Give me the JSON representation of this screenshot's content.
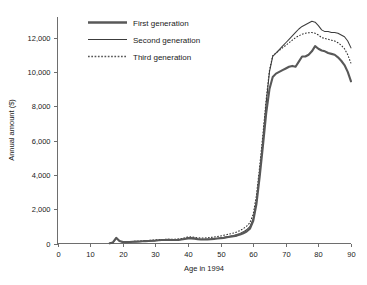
{
  "chart_data": {
    "type": "line",
    "title": "",
    "xlabel": "Age in 1994",
    "ylabel": "Annual amount ($)",
    "xlim": [
      0,
      90
    ],
    "ylim": [
      0,
      13200
    ],
    "xticks": [
      0,
      10,
      20,
      30,
      40,
      50,
      60,
      70,
      80,
      90
    ],
    "xtick_labels": [
      "0",
      "10",
      "20",
      "30",
      "40",
      "50",
      "60",
      "70",
      "80",
      "90"
    ],
    "yticks": [
      0,
      2000,
      4000,
      6000,
      8000,
      10000,
      12000
    ],
    "ytick_labels": [
      "0",
      "2,000",
      "4,000",
      "6,000",
      "8,000",
      "10,000",
      "12,000"
    ],
    "grid": false,
    "legend_position": "top-left-inside",
    "colors": {
      "first": "#585858",
      "second": "#3c3c3c",
      "third": "#2e2e2e",
      "axis": "#6e6e6e",
      "text": "#1a1a1a",
      "background": "#ffffff"
    },
    "series": [
      {
        "name": "First generation",
        "style": "solid-thick",
        "x": [
          16,
          17,
          18,
          19,
          20,
          21,
          22,
          23,
          24,
          25,
          26,
          27,
          28,
          29,
          30,
          31,
          32,
          33,
          34,
          35,
          36,
          37,
          38,
          39,
          40,
          41,
          42,
          43,
          44,
          45,
          46,
          47,
          48,
          49,
          50,
          51,
          52,
          53,
          54,
          55,
          56,
          57,
          58,
          59,
          60,
          61,
          62,
          63,
          64,
          65,
          66,
          67,
          68,
          69,
          70,
          71,
          72,
          73,
          74,
          75,
          76,
          77,
          78,
          79,
          80,
          81,
          82,
          83,
          84,
          85,
          86,
          87,
          88,
          89,
          90
        ],
        "values": [
          10,
          60,
          330,
          150,
          90,
          80,
          90,
          100,
          110,
          120,
          130,
          140,
          150,
          160,
          170,
          190,
          200,
          200,
          210,
          200,
          200,
          210,
          230,
          260,
          300,
          300,
          280,
          250,
          230,
          230,
          240,
          250,
          270,
          290,
          310,
          330,
          360,
          390,
          420,
          460,
          520,
          600,
          700,
          860,
          1300,
          2300,
          3900,
          5700,
          7600,
          9000,
          9700,
          9900,
          10000,
          10100,
          10200,
          10300,
          10350,
          10300,
          10600,
          10900,
          10900,
          11000,
          11200,
          11500,
          11350,
          11250,
          11200,
          11100,
          11050,
          11000,
          10850,
          10650,
          10400,
          10000,
          9450
        ]
      },
      {
        "name": "Second generation",
        "style": "solid-thin",
        "x": [
          16,
          17,
          18,
          19,
          20,
          21,
          22,
          23,
          24,
          25,
          26,
          27,
          28,
          29,
          30,
          31,
          32,
          33,
          34,
          35,
          36,
          37,
          38,
          39,
          40,
          41,
          42,
          43,
          44,
          45,
          46,
          47,
          48,
          49,
          50,
          51,
          52,
          53,
          54,
          55,
          56,
          57,
          58,
          59,
          60,
          61,
          62,
          63,
          64,
          65,
          66,
          67,
          68,
          69,
          70,
          71,
          72,
          73,
          74,
          75,
          76,
          77,
          78,
          79,
          80,
          81,
          82,
          83,
          84,
          85,
          86,
          87,
          88,
          89,
          90
        ],
        "values": [
          5,
          40,
          310,
          140,
          80,
          70,
          80,
          90,
          100,
          110,
          120,
          130,
          140,
          150,
          165,
          180,
          190,
          195,
          200,
          195,
          195,
          210,
          240,
          280,
          330,
          340,
          320,
          280,
          250,
          240,
          250,
          265,
          285,
          305,
          330,
          360,
          395,
          430,
          470,
          520,
          590,
          680,
          800,
          980,
          1450,
          2500,
          4200,
          6100,
          8200,
          10000,
          10900,
          11100,
          11300,
          11500,
          11700,
          11900,
          12100,
          12300,
          12500,
          12650,
          12750,
          12850,
          12950,
          12900,
          12700,
          12450,
          12350,
          12350,
          12300,
          12300,
          12250,
          12150,
          12050,
          11800,
          11400
        ]
      },
      {
        "name": "Third generation",
        "style": "dotted",
        "x": [
          16,
          17,
          18,
          19,
          20,
          21,
          22,
          23,
          24,
          25,
          26,
          27,
          28,
          29,
          30,
          31,
          32,
          33,
          34,
          35,
          36,
          37,
          38,
          39,
          40,
          41,
          42,
          43,
          44,
          45,
          46,
          47,
          48,
          49,
          50,
          51,
          52,
          53,
          54,
          55,
          56,
          57,
          58,
          59,
          60,
          61,
          62,
          63,
          64,
          65,
          66,
          67,
          68,
          69,
          70,
          71,
          72,
          73,
          74,
          75,
          76,
          77,
          78,
          79,
          80,
          81,
          82,
          83,
          84,
          85,
          86,
          87,
          88,
          89,
          90
        ],
        "values": [
          8,
          50,
          320,
          160,
          110,
          100,
          110,
          120,
          130,
          145,
          155,
          170,
          180,
          195,
          210,
          225,
          235,
          240,
          245,
          245,
          250,
          265,
          290,
          330,
          380,
          385,
          365,
          335,
          320,
          320,
          335,
          355,
          380,
          410,
          440,
          480,
          520,
          565,
          615,
          675,
          760,
          870,
          1010,
          1210,
          1700,
          2800,
          4500,
          6400,
          8400,
          10100,
          10950,
          11100,
          11250,
          11400,
          11550,
          11700,
          11850,
          12000,
          12100,
          12200,
          12250,
          12280,
          12300,
          12250,
          12150,
          12000,
          11950,
          11900,
          11850,
          11800,
          11700,
          11550,
          11350,
          11000,
          10500
        ]
      }
    ]
  },
  "legend": {
    "items": [
      {
        "label": "First generation",
        "style": "solid-thick"
      },
      {
        "label": "Second generation",
        "style": "solid-thin"
      },
      {
        "label": "Third generation",
        "style": "dotted"
      }
    ]
  }
}
